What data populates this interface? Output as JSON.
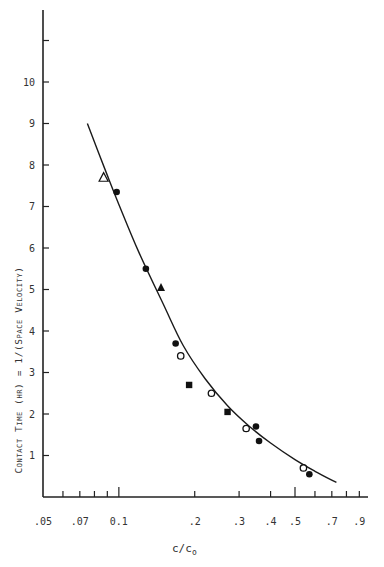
{
  "chart_data": {
    "type": "scatter",
    "title": "",
    "xlabel": "c/c0",
    "xlabel_main": "c/c",
    "xlabel_sub": "o",
    "ylabel": "Contact Time (hr) = 1/(Space Velocity)",
    "x_scale": "log",
    "xlim": [
      0.05,
      0.95
    ],
    "ylim": [
      0,
      11.5
    ],
    "grid": false,
    "x_ticks": [
      {
        "value": 0.05,
        "label": ".05",
        "major": true
      },
      {
        "value": 0.06,
        "label": "",
        "major": false
      },
      {
        "value": 0.07,
        "label": ".07",
        "major": false
      },
      {
        "value": 0.08,
        "label": "",
        "major": false
      },
      {
        "value": 0.09,
        "label": "",
        "major": false
      },
      {
        "value": 0.1,
        "label": "0.1",
        "major": true
      },
      {
        "value": 0.2,
        "label": ".2",
        "major": false
      },
      {
        "value": 0.3,
        "label": ".3",
        "major": false
      },
      {
        "value": 0.4,
        "label": ".4",
        "major": false
      },
      {
        "value": 0.5,
        "label": ".5",
        "major": true
      },
      {
        "value": 0.6,
        "label": "",
        "major": false
      },
      {
        "value": 0.7,
        "label": ".7",
        "major": false
      },
      {
        "value": 0.8,
        "label": "",
        "major": false
      },
      {
        "value": 0.9,
        "label": ".9",
        "major": false
      }
    ],
    "y_ticks": [
      {
        "value": 1,
        "label": "1"
      },
      {
        "value": 2,
        "label": "2"
      },
      {
        "value": 3,
        "label": "3"
      },
      {
        "value": 4,
        "label": "4"
      },
      {
        "value": 5,
        "label": "5"
      },
      {
        "value": 6,
        "label": "6"
      },
      {
        "value": 7,
        "label": "7"
      },
      {
        "value": 8,
        "label": "8"
      },
      {
        "value": 9,
        "label": "9"
      },
      {
        "value": 10,
        "label": "10"
      },
      {
        "value": 11,
        "label": ""
      }
    ],
    "series": [
      {
        "name": "open-triangle",
        "marker": "triangle-open",
        "points": [
          [
            0.087,
            7.7
          ]
        ]
      },
      {
        "name": "filled-circle",
        "marker": "circle-filled",
        "points": [
          [
            0.098,
            7.35
          ],
          [
            0.128,
            5.5
          ],
          [
            0.168,
            3.7
          ],
          [
            0.35,
            1.7
          ],
          [
            0.36,
            1.35
          ],
          [
            0.57,
            0.55
          ]
        ]
      },
      {
        "name": "filled-triangle",
        "marker": "triangle-filled",
        "points": [
          [
            0.147,
            5.05
          ]
        ]
      },
      {
        "name": "open-circle",
        "marker": "circle-open",
        "points": [
          [
            0.176,
            3.4
          ],
          [
            0.233,
            2.5
          ],
          [
            0.32,
            1.65
          ],
          [
            0.54,
            0.7
          ]
        ]
      },
      {
        "name": "filled-square",
        "marker": "square-filled",
        "points": [
          [
            0.19,
            2.7
          ],
          [
            0.27,
            2.05
          ]
        ]
      }
    ],
    "fit_curve": {
      "name": "fitted curve",
      "points": [
        [
          0.075,
          9.0
        ],
        [
          0.09,
          7.75
        ],
        [
          0.1,
          7.05
        ],
        [
          0.12,
          5.9
        ],
        [
          0.15,
          4.65
        ],
        [
          0.18,
          3.65
        ],
        [
          0.22,
          2.85
        ],
        [
          0.27,
          2.2
        ],
        [
          0.33,
          1.7
        ],
        [
          0.4,
          1.3
        ],
        [
          0.5,
          0.9
        ],
        [
          0.6,
          0.62
        ],
        [
          0.73,
          0.35
        ]
      ]
    }
  }
}
